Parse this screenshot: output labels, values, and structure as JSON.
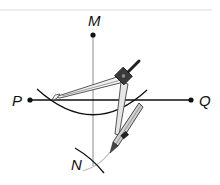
{
  "diagram": {
    "points": [
      {
        "id": "M",
        "label": "M",
        "x": 93,
        "y": 35,
        "label_x": 88,
        "label_y": 26
      },
      {
        "id": "P",
        "label": "P",
        "x": 30,
        "y": 100,
        "label_x": 12,
        "label_y": 106
      },
      {
        "id": "Q",
        "label": "Q",
        "x": 191,
        "y": 100,
        "label_x": 199,
        "label_y": 106
      },
      {
        "id": "N",
        "label": "N",
        "x": 93,
        "y": 164,
        "label_x": 71,
        "label_y": 170
      }
    ],
    "labels": {
      "M": "M",
      "P": "P",
      "Q": "Q",
      "N": "N"
    },
    "lines": [
      {
        "name": "line-PQ",
        "from": "P",
        "to": "Q"
      },
      {
        "name": "perpendicular-MN",
        "from": "M",
        "to": "N"
      }
    ],
    "arcs": [
      {
        "name": "arc-centered-M",
        "description": "arc cutting PQ at two points"
      },
      {
        "name": "arc-at-N",
        "description": "intersecting arcs below PQ locating N"
      }
    ],
    "tool": "compass",
    "colors": {
      "ink": "#111111",
      "construction_line": "#9a9a9a",
      "compass_fill": "#d8d8d8",
      "compass_dark": "#333333"
    }
  }
}
